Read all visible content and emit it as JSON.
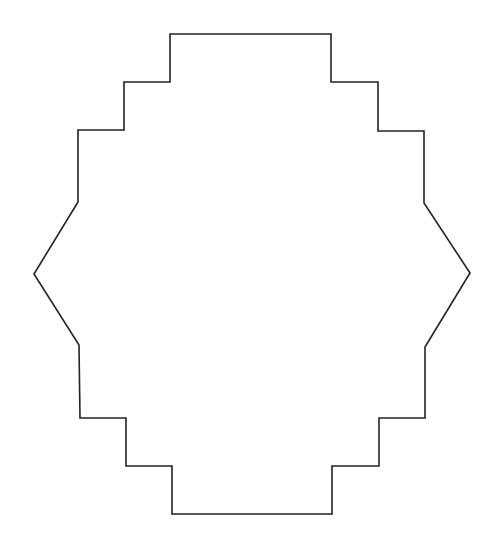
{
  "diagram": {
    "type": "stepped-polygon-outline",
    "stroke_color": "#222222",
    "fill_color": "#ffffff",
    "stroke_width": 1.6,
    "points": [
      [
        170,
        34
      ],
      [
        331,
        34
      ],
      [
        331,
        82
      ],
      [
        378,
        82
      ],
      [
        378,
        131
      ],
      [
        424,
        131
      ],
      [
        424,
        203
      ],
      [
        470,
        273
      ],
      [
        425,
        347
      ],
      [
        425,
        418
      ],
      [
        379,
        418
      ],
      [
        379,
        466
      ],
      [
        332,
        466
      ],
      [
        332,
        514
      ],
      [
        172,
        514
      ],
      [
        172,
        466
      ],
      [
        126,
        466
      ],
      [
        126,
        418
      ],
      [
        80,
        418
      ],
      [
        79,
        345
      ],
      [
        34,
        274
      ],
      [
        78,
        202
      ],
      [
        78,
        130
      ],
      [
        124,
        130
      ],
      [
        124,
        82
      ],
      [
        170,
        82
      ]
    ]
  }
}
